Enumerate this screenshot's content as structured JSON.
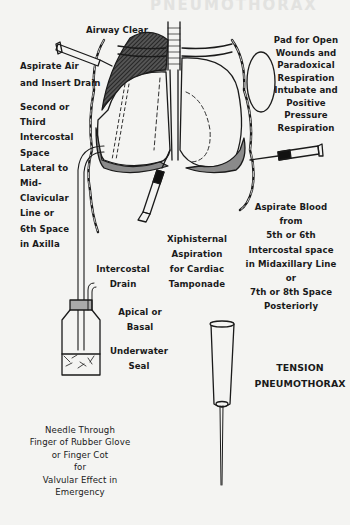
{
  "title": "TENSION PNEUMOTHORAX",
  "title_lines": [
    "TENSION",
    "PNEUMOTHORAX"
  ],
  "ghost_header": "PNEUMOTHORAX",
  "labels": {
    "airway": "Airway Clear",
    "aspirate_air": [
      "Aspirate Air",
      "and Insert Drain"
    ],
    "site_left": [
      "Second or",
      "Third",
      "Intercostal",
      "Space",
      "Lateral to",
      "Mid-",
      "Clavicular",
      "Line or",
      "6th Space",
      "in Axilla"
    ],
    "pad": [
      "Pad for Open",
      "Wounds and",
      "Paradoxical",
      "Respiration",
      "Intubate and",
      "Positive",
      "Pressure",
      "Respiration"
    ],
    "aspirate_blood": [
      "Aspirate Blood",
      "from",
      "5th or 6th",
      "Intercostal space",
      "in Midaxillary Line",
      "or",
      "7th or 8th Space",
      "Posteriorly"
    ],
    "xiphisternal": [
      "Xiphisternal",
      "Aspiration",
      "for Cardiac",
      "Tamponade"
    ],
    "intercostal_drain": [
      "Intercostal",
      "Drain"
    ],
    "apical_basal": [
      "Apical or",
      "Basal"
    ],
    "underwater_seal": [
      "Underwater",
      "Seal"
    ],
    "needle_note": [
      "Needle Through",
      "Finger of Rubber Glove",
      "or Finger Cot",
      "for",
      "Valvular Effect in",
      "Emergency"
    ]
  },
  "colors": {
    "ink": "#1a1a1a",
    "paper": "#f4f4f2",
    "shade": "#8a8a8a"
  }
}
